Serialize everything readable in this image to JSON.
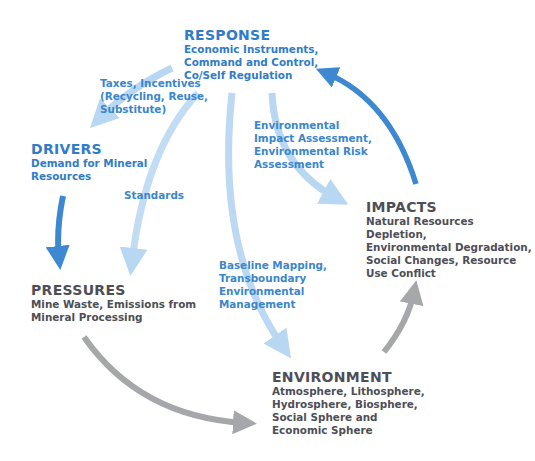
{
  "diagram": {
    "type": "DPSIR cycle",
    "colors": {
      "response_text": "#2f7cc7",
      "gray_text": "#4d4e56",
      "dark_blue_arrow": "#3d88d0",
      "light_blue_arrow": "#b8d7f2",
      "gray_arrow": "#a6a7ab"
    },
    "nodes": {
      "response": {
        "title": "RESPONSE",
        "desc": "Economic Instruments,\nCommand and Control,\nCo/Self Regulation"
      },
      "drivers": {
        "title": "DRIVERS",
        "desc": "Demand for Mineral\nResources"
      },
      "pressures": {
        "title": "PRESSURES",
        "desc": "Mine Waste, Emissions from\nMineral Processing"
      },
      "environment": {
        "title": "ENVIRONMENT",
        "desc": "Atmosphere, Lithosphere,\nHydrosphere, Biosphere,\nSocial Sphere and\nEconomic Sphere"
      },
      "impacts": {
        "title": "IMPACTS",
        "desc": "Natural Resources Depletion,\nEnvironmental Degradation,\nSocial Changes, Resource\nUse Conflict"
      }
    },
    "edge_labels": {
      "taxes": "Taxes, Incentives\n(Recycling, Reuse,\nSubstitute)",
      "standards": "Standards",
      "eia": "Environmental\nImpact Assessment,\nEnvironmental Risk\nAssessment",
      "baseline": "Baseline Mapping,\nTransboundary\nEnvironmental\nManagement"
    },
    "edges": [
      {
        "from": "response",
        "to": "drivers",
        "label": "Taxes, Incentives (Recycling, Reuse, Substitute)"
      },
      {
        "from": "response",
        "to": "pressures",
        "label": "Standards"
      },
      {
        "from": "response",
        "to": "environment",
        "label": "Baseline Mapping, Transboundary Environmental Management"
      },
      {
        "from": "response",
        "to": "impacts",
        "label": "Environmental Impact Assessment, Environmental Risk Assessment"
      },
      {
        "from": "drivers",
        "to": "pressures",
        "label": ""
      },
      {
        "from": "pressures",
        "to": "environment",
        "label": ""
      },
      {
        "from": "environment",
        "to": "impacts",
        "label": ""
      },
      {
        "from": "impacts",
        "to": "response",
        "label": ""
      }
    ]
  }
}
